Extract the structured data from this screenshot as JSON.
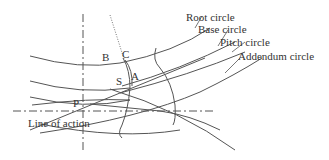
{
  "diagram": {
    "type": "gear tooth involute geometry",
    "labels": {
      "root_circle": "Root circle",
      "base_circle": "Base circle",
      "pitch_circle": "Pitch circle",
      "addendum_circle": "Addendum circle",
      "line_of_action": "Line of action"
    },
    "points": {
      "B": "B",
      "C": "C",
      "S": "S",
      "A": "A",
      "P": "P"
    },
    "colors": {
      "stroke": "#555555",
      "text": "#333333",
      "background": "#ffffff"
    }
  }
}
